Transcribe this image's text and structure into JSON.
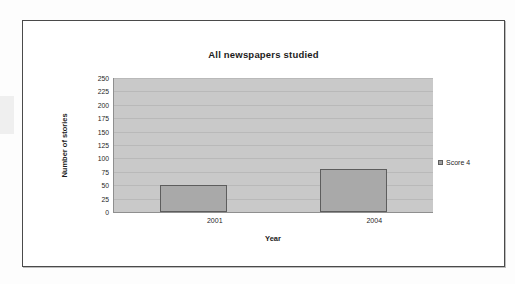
{
  "chart_data": {
    "type": "bar",
    "title": "All newspapers studied",
    "xlabel": "Year",
    "ylabel": "Number of stories",
    "categories": [
      "2001",
      "2004"
    ],
    "series": [
      {
        "name": "Score 4",
        "values": [
          50,
          80
        ],
        "color": "#a9a9a9"
      }
    ],
    "ylim": [
      0,
      250
    ],
    "ytick_labels": [
      "250",
      "225",
      "200",
      "175",
      "150",
      "125",
      "100",
      "75",
      "50",
      "25",
      "0"
    ],
    "ytick_values": [
      250,
      225,
      200,
      175,
      150,
      125,
      100,
      75,
      50,
      25,
      0
    ],
    "grid": true,
    "legend_position": "right",
    "plot_background": "#c9c9c9",
    "bar_border_color": "#5d5d5d"
  },
  "legend": {
    "entries": [
      {
        "label": "Score 4",
        "swatch_name": "legend-swatch-score-4"
      }
    ]
  }
}
